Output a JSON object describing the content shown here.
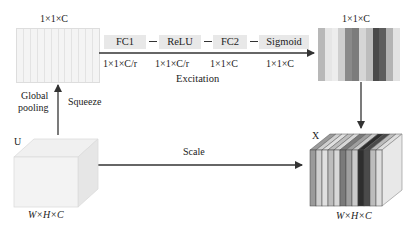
{
  "diagram": {
    "input_vector": {
      "label": "1×1×C",
      "stripe_count": 12
    },
    "output_vector": {
      "label": "1×1×C",
      "stripe_colors": [
        "#b8b8b8",
        "#e6e6e6",
        "#ededed",
        "#cfcfcf",
        "#8a8a8a",
        "#7c7c7c",
        "#d6d6d6",
        "#bdbdbd",
        "#4a4a4a",
        "#5d5d5d",
        "#b3b3b3",
        "#e2e2e2"
      ]
    },
    "excitation": {
      "label": "Excitation",
      "steps": [
        {
          "name": "FC1",
          "dim": "1×1×C/r"
        },
        {
          "name": "ReLU",
          "dim": "1×1×C/r"
        },
        {
          "name": "FC2",
          "dim": "1×1×C"
        },
        {
          "name": "Sigmoid",
          "dim": "1×1×C"
        }
      ]
    },
    "squeeze": {
      "label": "Squeeze",
      "op_label_line1": "Global",
      "op_label_line2": "pooling"
    },
    "input_tensor": {
      "name": "U",
      "dims": "W×H×C"
    },
    "scale": {
      "label": "Scale"
    },
    "output_tensor": {
      "name": "X",
      "dims": "W×H×C",
      "slice_colors": [
        "#9a9a9a",
        "#cfcfcf",
        "#e0e0e0",
        "#bdbdbd",
        "#d8d8d8",
        "#7a7a7a",
        "#9f9f9f",
        "#cacaca",
        "#2e2e2e",
        "#4a4a4a",
        "#bcbcbc",
        "#dedede"
      ]
    }
  }
}
